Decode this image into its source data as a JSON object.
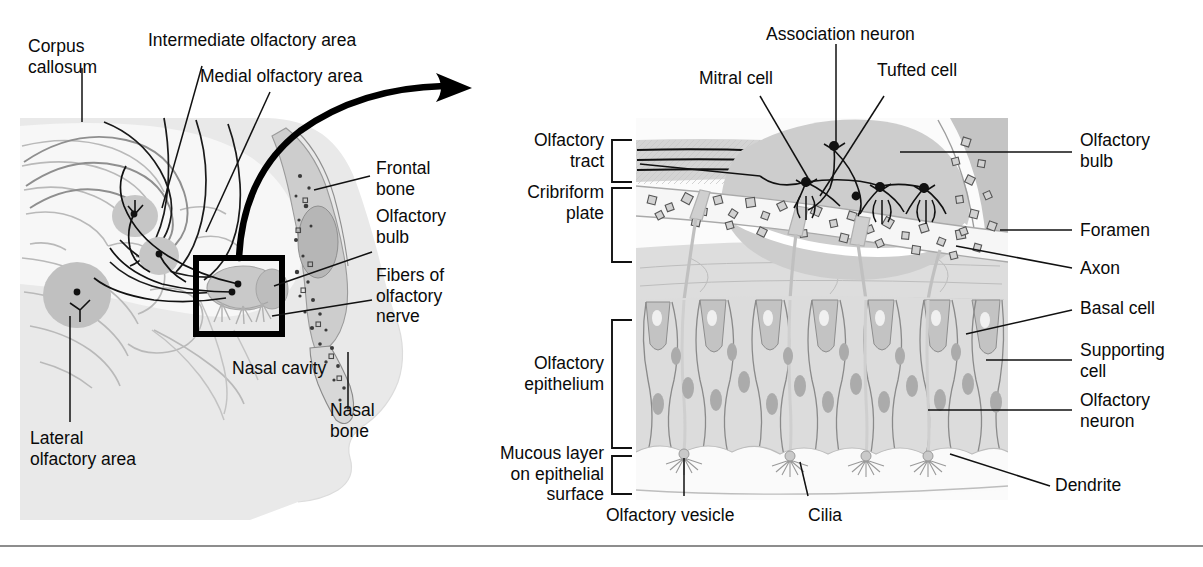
{
  "figure": {
    "type": "anatomical-diagram",
    "panels": [
      "sagittal head section with olfactory pathway",
      "magnified olfactory membrane and bulb"
    ]
  },
  "left_panel": {
    "name": "sagittal-head-section",
    "labels": [
      {
        "id": "corpus-callosum",
        "text": "Corpus\ncallosum"
      },
      {
        "id": "intermediate-olfactory-area",
        "text": "Intermediate olfactory area"
      },
      {
        "id": "medial-olfactory-area",
        "text": "Medial olfactory area"
      },
      {
        "id": "frontal-bone",
        "text": "Frontal\nbone"
      },
      {
        "id": "olfactory-bulb",
        "text": "Olfactory\nbulb"
      },
      {
        "id": "fibers-of-olfactory-nerve",
        "text": "Fibers of\nolfactory\nnerve"
      },
      {
        "id": "nasal-cavity",
        "text": "Nasal cavity"
      },
      {
        "id": "nasal-bone",
        "text": "Nasal\nbone"
      },
      {
        "id": "lateral-olfactory-area",
        "text": "Lateral\nolfactory area"
      }
    ],
    "callout_box": "magnified region indicator"
  },
  "right_panel": {
    "name": "olfactory-membrane-detail",
    "labels": [
      {
        "id": "mitral-cell",
        "text": "Mitral cell"
      },
      {
        "id": "association-neuron",
        "text": "Association neuron"
      },
      {
        "id": "tufted-cell",
        "text": "Tufted cell"
      },
      {
        "id": "olfactory-bulb",
        "text": "Olfactory\nbulb"
      },
      {
        "id": "olfactory-tract",
        "text": "Olfactory\ntract"
      },
      {
        "id": "cribriform-plate",
        "text": "Cribriform\nplate"
      },
      {
        "id": "foramen",
        "text": "Foramen"
      },
      {
        "id": "axon",
        "text": "Axon"
      },
      {
        "id": "basal-cell",
        "text": "Basal cell"
      },
      {
        "id": "supporting-cell",
        "text": "Supporting\ncell"
      },
      {
        "id": "olfactory-neuron",
        "text": "Olfactory\nneuron"
      },
      {
        "id": "olfactory-epithelium",
        "text": "Olfactory\nepithelium"
      },
      {
        "id": "mucous-layer",
        "text": "Mucous layer\non epithelial\nsurface"
      },
      {
        "id": "olfactory-vesicle",
        "text": "Olfactory vesicle"
      },
      {
        "id": "cilia",
        "text": "Cilia"
      },
      {
        "id": "dendrite",
        "text": "Dendrite"
      }
    ]
  },
  "colors": {
    "ink": "#0a0a0a",
    "tissue_light": "#e6e6e6",
    "tissue_mid": "#cfcfcf",
    "tissue_dark": "#b4b4b4",
    "nucleus": "#a8a8a8",
    "rule": "#8d8d8d"
  }
}
